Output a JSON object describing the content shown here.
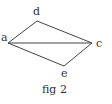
{
  "figure": {
    "caption": "fig 2",
    "points": [
      {
        "id": "a",
        "label": "a",
        "x": 8,
        "y": 43,
        "label_x": 2,
        "label_y": 41
      },
      {
        "id": "d",
        "label": "d",
        "x": 37,
        "y": 21,
        "label_x": 33,
        "label_y": 15
      },
      {
        "id": "c",
        "label": "c",
        "x": 92,
        "y": 43,
        "label_x": 97,
        "label_y": 47
      },
      {
        "id": "e",
        "label": "e",
        "x": 64,
        "y": 66,
        "label_x": 61,
        "label_y": 76
      }
    ],
    "segments": [
      [
        "a",
        "d"
      ],
      [
        "d",
        "c"
      ],
      [
        "a",
        "c"
      ],
      [
        "a",
        "e"
      ],
      [
        "e",
        "c"
      ]
    ],
    "line_color": "#444444",
    "text_color": "#333333"
  }
}
